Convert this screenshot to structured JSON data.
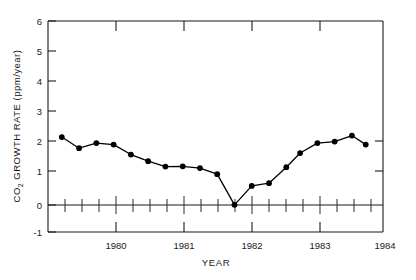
{
  "chart_data": {
    "type": "line",
    "title": "",
    "xlabel": "YEAR",
    "ylabel": "CO2 GROWTH RATE (ppm/year)",
    "ylabel_parts": {
      "prefix": "CO",
      "subscript": "2",
      "suffix": " GROWTH RATE (ppm/year)"
    },
    "xlim": [
      1979.4,
      1984.25
    ],
    "ylim": [
      -1,
      6
    ],
    "yticks": [
      -1,
      0,
      1,
      2,
      3,
      4,
      5,
      6
    ],
    "ytick_labels": [
      "-1",
      "0",
      "1",
      "2",
      "3",
      "4",
      "5",
      "6"
    ],
    "xticks": [
      1980,
      1981,
      1982,
      1983,
      1984
    ],
    "xtick_labels": [
      "1980",
      "1981",
      "1982",
      "1983",
      "1984"
    ],
    "x_minor_step": 0.25,
    "grid": false,
    "legend": null,
    "marker": "filled-circle",
    "x": [
      1979.6,
      1979.85,
      1980.1,
      1980.35,
      1980.6,
      1980.85,
      1981.1,
      1981.35,
      1981.6,
      1981.85,
      1982.1,
      1982.25,
      1982.45,
      1982.7,
      1982.9,
      1983.1,
      1983.35,
      1983.6,
      1983.85,
      1984.0
    ],
    "values": [
      2.15,
      1.78,
      1.95,
      1.9,
      1.57,
      1.35,
      1.17,
      1.18,
      1.12,
      0.92,
      -0.1,
      -0.1,
      0.53,
      0.62,
      1.15,
      1.62,
      1.95,
      2.0,
      2.2,
      1.9
    ],
    "points": [
      {
        "x": 1979.6,
        "y": 2.15
      },
      {
        "x": 1979.85,
        "y": 1.78
      },
      {
        "x": 1980.1,
        "y": 1.95
      },
      {
        "x": 1980.35,
        "y": 1.9
      },
      {
        "x": 1980.6,
        "y": 1.57
      },
      {
        "x": 1980.85,
        "y": 1.35
      },
      {
        "x": 1981.1,
        "y": 1.17
      },
      {
        "x": 1981.35,
        "y": 1.18
      },
      {
        "x": 1981.6,
        "y": 1.12
      },
      {
        "x": 1981.85,
        "y": 0.92
      },
      {
        "x": 1982.1,
        "y": -0.1
      },
      {
        "x": 1982.35,
        "y": 0.53
      },
      {
        "x": 1982.6,
        "y": 0.62
      },
      {
        "x": 1982.85,
        "y": 1.15
      },
      {
        "x": 1983.05,
        "y": 1.62
      },
      {
        "x": 1983.3,
        "y": 1.95
      },
      {
        "x": 1983.55,
        "y": 2.0
      },
      {
        "x": 1983.8,
        "y": 2.2
      },
      {
        "x": 1984.0,
        "y": 1.9
      }
    ],
    "colors": {
      "line": "#000000",
      "marker": "#000000",
      "axis": "#1a1a1a",
      "background": "#ffffff"
    }
  }
}
